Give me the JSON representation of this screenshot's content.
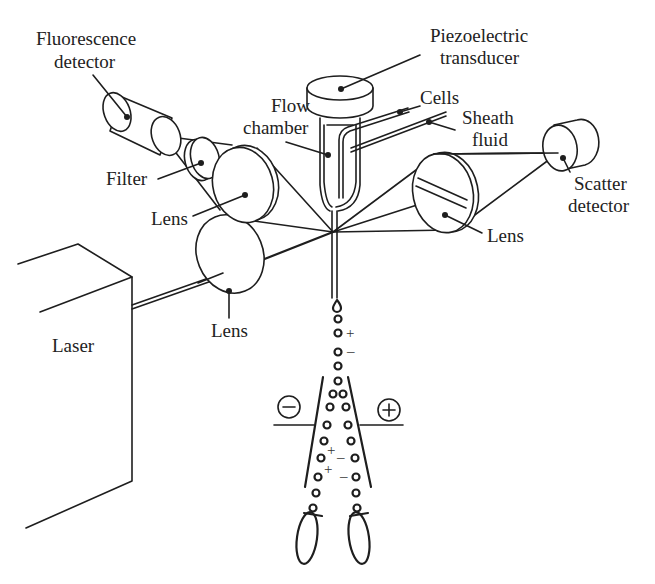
{
  "diagram": {
    "labels": {
      "fluorescence_detector": [
        "Fluorescence",
        "detector"
      ],
      "piezoelectric_transducer": [
        "Piezoelectric",
        "transducer"
      ],
      "cells": "Cells",
      "sheath_fluid": [
        "Sheath",
        "fluid"
      ],
      "flow_chamber": [
        "Flow",
        "chamber"
      ],
      "filter": "Filter",
      "lens_fluorescence": "Lens",
      "lens_scatter": "Lens",
      "scatter_detector": [
        "Scatter",
        "detector"
      ],
      "lens_laser": "Lens",
      "laser": "Laser"
    },
    "charge_symbols": {
      "plus": "+",
      "minus": "–",
      "negative_plate": "−",
      "positive_plate": "+"
    },
    "colors": {
      "ink": "#1e1e1e",
      "text": "#222222",
      "background": "#ffffff"
    }
  }
}
